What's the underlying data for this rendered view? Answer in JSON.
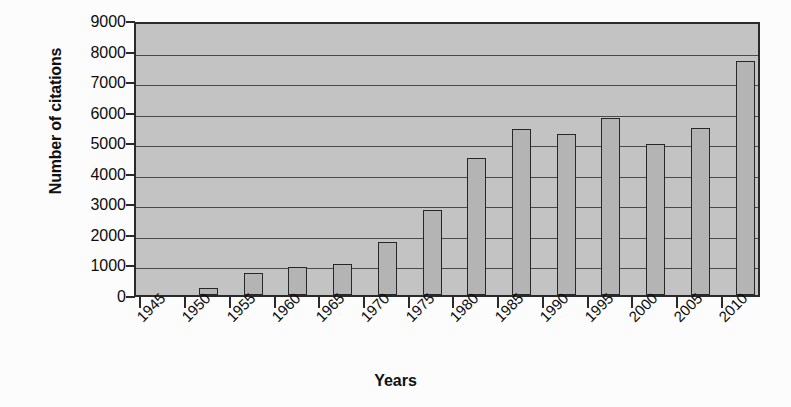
{
  "chart_data": {
    "type": "bar",
    "title": "",
    "xlabel": "Years",
    "ylabel": "Number of citations",
    "categories": [
      "1945",
      "1950",
      "1955",
      "1960",
      "1965",
      "1970",
      "1975",
      "1980",
      "1985",
      "1990",
      "1995",
      "2000",
      "2005",
      "2010"
    ],
    "values": [
      0,
      230,
      730,
      920,
      1000,
      1720,
      2780,
      4480,
      5430,
      5280,
      5790,
      4940,
      5460,
      7670
    ],
    "series": [
      {
        "name": "Number of citations",
        "values": [
          0,
          230,
          730,
          920,
          1000,
          1720,
          2780,
          4480,
          5430,
          5280,
          5790,
          4940,
          5460,
          7670
        ]
      }
    ],
    "ylim": [
      0,
      9000
    ],
    "yticks": [
      0,
      1000,
      2000,
      3000,
      4000,
      5000,
      6000,
      7000,
      8000,
      9000
    ],
    "ytick_labels": [
      "0",
      "1000",
      "2000",
      "3000",
      "4000",
      "5000",
      "6000",
      "7000",
      "8000",
      "9000"
    ],
    "xtick_labels": [
      "1945",
      "1950",
      "1955",
      "1960",
      "1965",
      "1970",
      "1975",
      "1980",
      "1985",
      "1990",
      "1995",
      "2000",
      "2005",
      "2010"
    ],
    "xtick_rotation": -45,
    "grid": true,
    "grid_axis": "y",
    "legend": false,
    "legend_position": "none",
    "colors": {
      "plot_background": "#c3c3c3",
      "figure_background": "#fcfcfc",
      "bar_fill": "#b4b4b4",
      "bar_edge": "#272727",
      "gridline": "#4a4a4a",
      "axis": "#2a2a2a",
      "text": "#0d0d0d"
    }
  }
}
